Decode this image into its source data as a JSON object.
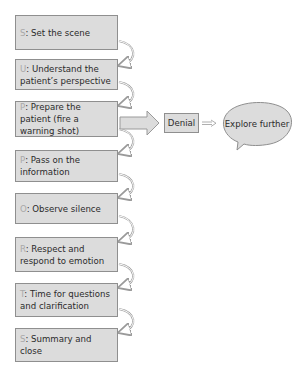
{
  "diagram": {
    "steps": [
      {
        "letter": "S",
        "text": ": Set the scene"
      },
      {
        "letter": "U",
        "text": ": Understand the patient’s perspective"
      },
      {
        "letter": "P",
        "text": ": Prepare the patient (fire a warning shot)"
      },
      {
        "letter": "P",
        "text": ": Pass on the information"
      },
      {
        "letter": "O",
        "text": ": Observe silence"
      },
      {
        "letter": "R",
        "text": ": Respect and respond to emotion"
      },
      {
        "letter": "T",
        "text": ": Time for questions and clarification"
      },
      {
        "letter": "S",
        "text": ": Summary and close"
      }
    ],
    "branch": {
      "denial_label": "Denial",
      "explore_label": "Explore further"
    },
    "colors": {
      "box_fill": "#dcdcdc",
      "box_border": "#8f8f8f",
      "letter": "#a9a9a9",
      "text": "#2b2b2b"
    }
  }
}
